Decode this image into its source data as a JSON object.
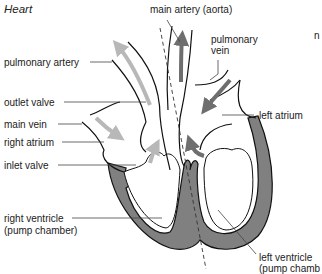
{
  "title": "Heart",
  "labels": {
    "main_artery": "main artery (aorta)",
    "pulmonary_artery": "pulmonary artery",
    "pulmonary_vein_line1": "pulmonary",
    "pulmonary_vein_line2": "vein",
    "outlet_valve": "outlet valve",
    "main_vein": "main vein",
    "right_atrium": "right atrium",
    "inlet_valve": "inlet valve",
    "left_atrium": "left atrium",
    "right_ventricle_line1": "right ventricle",
    "right_ventricle_line2": "(pump chamber)",
    "left_ventricle_line1": "left ventricle",
    "left_ventricle_line2": "(pump chamb",
    "cut_off_text": "n"
  },
  "colors": {
    "muscle": "#808080",
    "outline": "#111111",
    "deoxygenated_arrow": "#b8b8b8",
    "oxygenated_arrow": "#6e6e6e",
    "leader_line": "#444444"
  }
}
